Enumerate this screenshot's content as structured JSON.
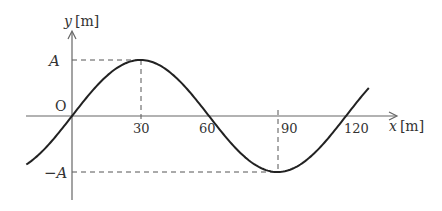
{
  "diagram": {
    "type": "transverse-wave-graph",
    "axes": {
      "x_label_var": "x",
      "x_label_unit": "[m]",
      "y_label_var": "y",
      "y_label_unit": "[m]",
      "origin_label": "O"
    },
    "x_ticks": [
      "30",
      "60",
      "90",
      "120"
    ],
    "y_ticks": {
      "positive": "A",
      "negative": "−A"
    },
    "curve": {
      "function": "y = A sin(2πx/120)",
      "wavelength": 120,
      "amplitude": "A",
      "x_range": [
        -20,
        130
      ],
      "color": "#222222"
    },
    "guides": [
      {
        "type": "horizontal-dashed",
        "at": "A",
        "from_x": 0,
        "to_x": 30
      },
      {
        "type": "vertical-dashed",
        "at_x": 30,
        "from": 0,
        "to": "A"
      },
      {
        "type": "horizontal-dashed",
        "at": "−A",
        "from_x": 0,
        "to_x": 90
      },
      {
        "type": "vertical-dashed",
        "at_x": 90,
        "from": 0,
        "to": "−A"
      }
    ]
  }
}
